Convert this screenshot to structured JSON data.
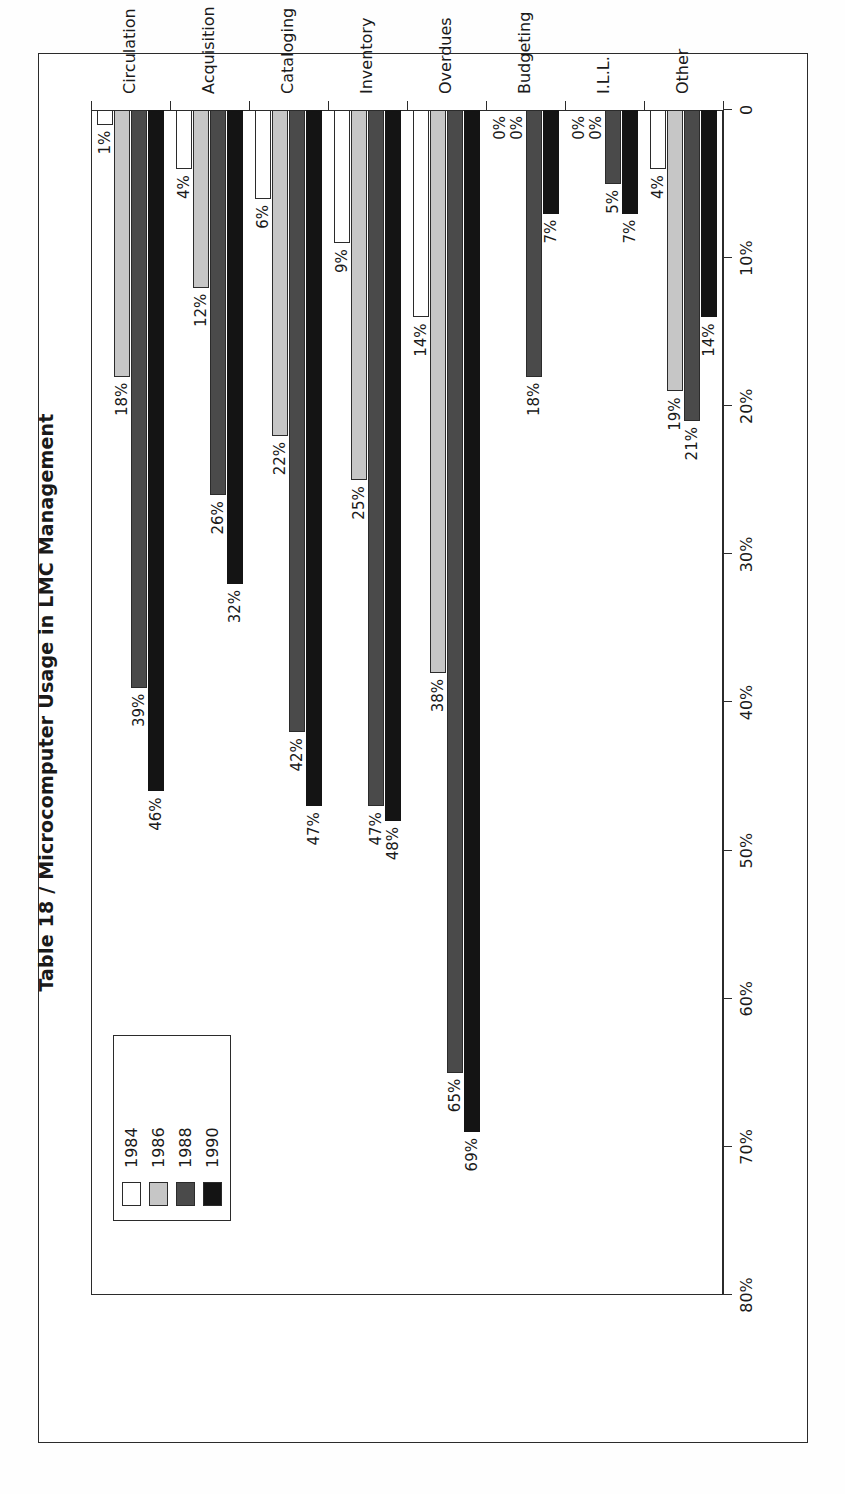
{
  "figure": {
    "title": "Table 18  /  Microcomputer Usage in LMC Management"
  },
  "legend": {
    "entries": [
      {
        "label": "1984",
        "color": "#ffffff",
        "swatch_name": "legend-swatch-1984"
      },
      {
        "label": "1986",
        "color": "#c6c6c6",
        "swatch_name": "legend-swatch-1986"
      },
      {
        "label": "1988",
        "color": "#4a4a4a",
        "swatch_name": "legend-swatch-1988"
      },
      {
        "label": "1990",
        "color": "#141414",
        "swatch_name": "legend-swatch-1990"
      }
    ]
  },
  "axis": {
    "tick_labels": [
      "80%",
      "70%",
      "60%",
      "50%",
      "40%",
      "30%",
      "20%",
      "10%",
      "0"
    ],
    "tick_values": [
      80,
      70,
      60,
      50,
      40,
      30,
      20,
      10,
      0
    ]
  },
  "chart_data": {
    "type": "bar",
    "orientation": "horizontal",
    "title": "Table 18  /  Microcomputer Usage in LMC Management",
    "xlabel": "",
    "ylabel": "",
    "xlim": [
      0,
      80
    ],
    "grid": false,
    "legend_position": "upper-left",
    "value_suffix": "%",
    "categories": [
      "Circulation",
      "Acquisition",
      "Cataloging",
      "Inventory",
      "Overdues",
      "Budgeting",
      "I.L.L.",
      "Other"
    ],
    "series": [
      {
        "name": "1984",
        "color": "#ffffff",
        "values": [
          1,
          4,
          6,
          9,
          14,
          0,
          0,
          4
        ],
        "labels": [
          "1%",
          "4%",
          "6%",
          "9%",
          "14%",
          "0%",
          "0%",
          "4%"
        ]
      },
      {
        "name": "1986",
        "color": "#c6c6c6",
        "values": [
          18,
          12,
          22,
          25,
          38,
          0,
          0,
          19
        ],
        "labels": [
          "18%",
          "12%",
          "22%",
          "25%",
          "38%",
          "0%",
          "0%",
          "19%"
        ]
      },
      {
        "name": "1988",
        "color": "#4a4a4a",
        "values": [
          39,
          26,
          42,
          47,
          65,
          18,
          5,
          21
        ],
        "labels": [
          "39%",
          "26%",
          "42%",
          "47%",
          "65%",
          "18%",
          "5%",
          "21%"
        ]
      },
      {
        "name": "1990",
        "color": "#141414",
        "values": [
          46,
          32,
          47,
          48,
          69,
          7,
          7,
          14
        ],
        "labels": [
          "46%",
          "32%",
          "47%",
          "48%",
          "69%",
          "7%",
          "7%",
          "14%"
        ]
      }
    ]
  }
}
